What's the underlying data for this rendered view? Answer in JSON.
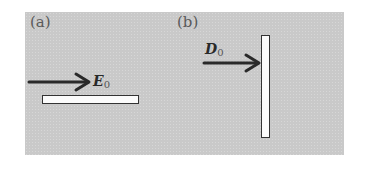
{
  "figure": {
    "panels": [
      {
        "id": "a",
        "label": "(a)",
        "vector": {
          "symbol": "E",
          "subscript": "0",
          "direction": "horizontal-right"
        },
        "plate": {
          "orientation": "horizontal"
        }
      },
      {
        "id": "b",
        "label": "(b)",
        "vector": {
          "symbol": "D",
          "subscript": "0",
          "direction": "horizontal-right"
        },
        "plate": {
          "orientation": "vertical"
        }
      }
    ],
    "colors": {
      "background": "#c9c9c9",
      "plate_fill": "#fbfbfb",
      "ink": "#2a2a2a"
    }
  }
}
